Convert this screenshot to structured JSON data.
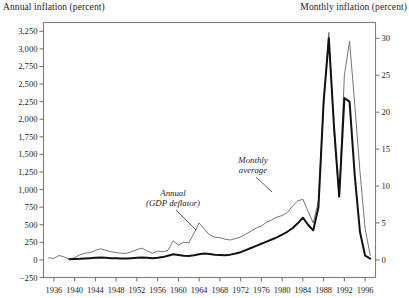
{
  "figure": {
    "left_axis_title": "Annual inflation (percent)",
    "right_axis_title": "Monthly inflation (percent)"
  },
  "annotations": {
    "annual_line1": "Annual",
    "annual_line2": "(GDP deflator)",
    "monthly_line1": "Monthly",
    "monthly_line2": "average"
  },
  "chart_data": {
    "type": "line",
    "title": "",
    "xlabel": "",
    "ylabel": "Annual inflation (percent)",
    "y2label": "Monthly inflation (percent)",
    "grid": false,
    "legend": "annotations-inline",
    "xlim": [
      1934,
      1998
    ],
    "ylim": [
      -250,
      3375
    ],
    "y2lim": [
      -2.38,
      32.14
    ],
    "xticks": [
      1936,
      1940,
      1944,
      1948,
      1952,
      1956,
      1960,
      1964,
      1968,
      1972,
      1976,
      1980,
      1984,
      1988,
      1992,
      1996
    ],
    "xtick_labels": [
      "1936",
      "1940",
      "1944",
      "1948",
      "1952",
      "1956",
      "1960",
      "1964",
      "1968",
      "1972",
      "1976",
      "1980",
      "1984",
      "1988",
      "1992",
      "1996"
    ],
    "yticks": [
      -250,
      0,
      250,
      500,
      750,
      1000,
      1250,
      1500,
      1750,
      2000,
      2250,
      2500,
      2750,
      3000,
      3250
    ],
    "ytick_labels": [
      "−250",
      "0",
      "250",
      "500",
      "750",
      "1,000",
      "1,250",
      "1,500",
      "1,750",
      "2,000",
      "2,250",
      "2,500",
      "2,750",
      "3,000",
      "3,250"
    ],
    "y2ticks": [
      0,
      5,
      10,
      15,
      20,
      25,
      30
    ],
    "y2tick_labels": [
      "0",
      "5",
      "10",
      "15",
      "20",
      "25",
      "30"
    ],
    "series": [
      {
        "name": "Monthly average",
        "axis": "right",
        "color": "#6e6e6e",
        "style": "thin",
        "x": [
          1935,
          1936,
          1937,
          1938,
          1939,
          1940,
          1941,
          1942,
          1943,
          1944,
          1945,
          1946,
          1947,
          1948,
          1949,
          1950,
          1951,
          1952,
          1953,
          1954,
          1955,
          1956,
          1957,
          1958,
          1959,
          1960,
          1961,
          1962,
          1963,
          1964,
          1965,
          1966,
          1967,
          1968,
          1969,
          1970,
          1971,
          1972,
          1973,
          1974,
          1975,
          1976,
          1977,
          1978,
          1979,
          1980,
          1981,
          1982,
          1983,
          1984,
          1985,
          1986,
          1987,
          1988,
          1989,
          1990,
          1991,
          1992,
          1993,
          1994,
          1995,
          1996,
          1997
        ],
        "values": [
          0.3,
          0.2,
          0.6,
          0.4,
          0.1,
          0.3,
          0.7,
          0.9,
          1.0,
          1.3,
          1.5,
          1.3,
          1.1,
          1.0,
          0.9,
          0.9,
          1.1,
          1.4,
          1.6,
          1.2,
          0.9,
          1.2,
          1.1,
          1.3,
          2.6,
          2.0,
          2.4,
          2.3,
          3.6,
          5.0,
          4.2,
          3.4,
          3.1,
          3.0,
          2.8,
          2.7,
          2.9,
          3.1,
          3.5,
          3.9,
          4.3,
          4.6,
          5.1,
          5.4,
          5.8,
          6.0,
          6.4,
          7.3,
          8.0,
          8.2,
          6.6,
          5.0,
          8.0,
          21.0,
          30.8,
          17.2,
          8.5,
          25.0,
          29.6,
          21.0,
          12.0,
          4.2,
          0.6
        ]
      },
      {
        "name": "Annual (GDP deflator)",
        "axis": "left",
        "color": "#121212",
        "style": "thick",
        "x": [
          1939,
          1940,
          1941,
          1942,
          1943,
          1944,
          1945,
          1946,
          1947,
          1948,
          1949,
          1950,
          1951,
          1952,
          1953,
          1954,
          1955,
          1956,
          1957,
          1958,
          1959,
          1960,
          1961,
          1962,
          1963,
          1964,
          1965,
          1966,
          1967,
          1968,
          1969,
          1970,
          1971,
          1972,
          1973,
          1974,
          1975,
          1976,
          1977,
          1978,
          1979,
          1980,
          1981,
          1982,
          1983,
          1984,
          1985,
          1986,
          1987,
          1988,
          1989,
          1990,
          1991,
          1992,
          1993,
          1994,
          1995,
          1996,
          1997
        ],
        "values": [
          10,
          12,
          15,
          20,
          25,
          30,
          35,
          30,
          25,
          22,
          20,
          20,
          25,
          30,
          35,
          30,
          25,
          30,
          40,
          60,
          80,
          70,
          60,
          55,
          65,
          80,
          90,
          85,
          75,
          70,
          65,
          75,
          90,
          110,
          140,
          170,
          200,
          230,
          260,
          290,
          320,
          360,
          400,
          450,
          520,
          600,
          500,
          420,
          750,
          2250,
          3150,
          1900,
          900,
          2300,
          2250,
          1200,
          400,
          60,
          20
        ]
      }
    ]
  }
}
